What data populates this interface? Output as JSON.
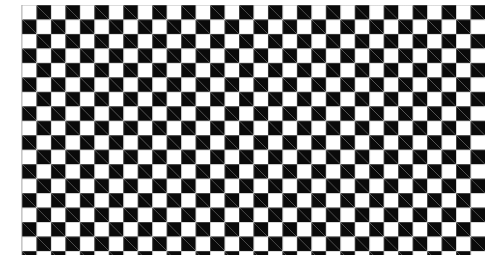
{
  "image": {
    "description": "Checkerboard pattern",
    "pattern": {
      "columns": 32,
      "rows_full": 17,
      "rows_partial": 1,
      "square_size_px": 14.47,
      "color_dark": "#0a0a0a",
      "color_light": "#ffffff",
      "top_left_square": "dark"
    }
  }
}
